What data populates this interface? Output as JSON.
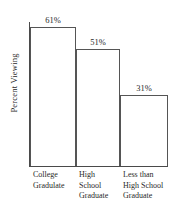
{
  "chart_data": {
    "type": "bar",
    "title": "",
    "xlabel": "",
    "ylabel": "Percent Viewing",
    "categories": [
      "College Gradulate",
      "High School Graduate",
      "Less than High School Graduate"
    ],
    "category_lines": [
      [
        "College",
        "Gradulate"
      ],
      [
        "High",
        "School",
        "Graduate"
      ],
      [
        "Less than",
        "High School",
        "Graduate"
      ]
    ],
    "values": [
      61,
      51,
      31
    ],
    "value_labels": [
      "61%",
      "51%",
      "31%"
    ],
    "ylim": [
      0,
      63
    ],
    "grid": false,
    "legend": "none",
    "bar_fill_color": "#ffffff",
    "bar_edge_color": "#555555",
    "axis_color": "#4a4a4a",
    "text_color": "#2a2a2a"
  }
}
